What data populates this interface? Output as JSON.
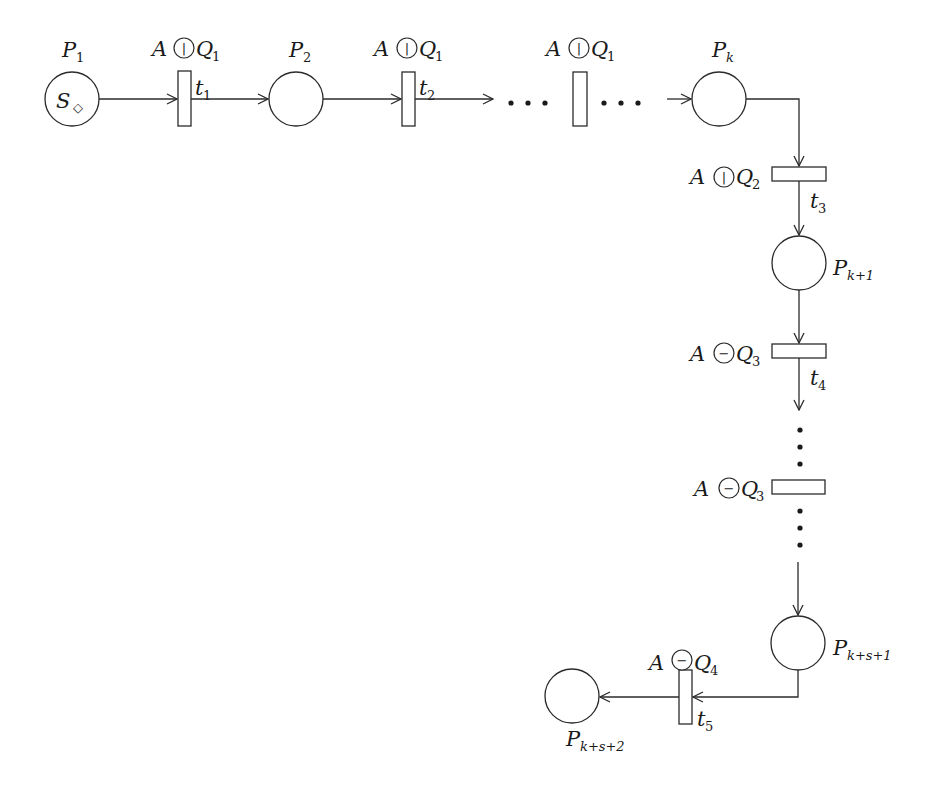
{
  "diagram": {
    "type": "petri-net",
    "places": [
      {
        "id": "P1",
        "label": "P",
        "sub": "1",
        "token": "S",
        "token_mark": "◇"
      },
      {
        "id": "P2",
        "label": "P",
        "sub": "2"
      },
      {
        "id": "Pk",
        "label": "P",
        "sub": "k"
      },
      {
        "id": "Pk1",
        "label": "P",
        "sub": "k+1"
      },
      {
        "id": "Pks1",
        "label": "P",
        "sub": "k+s+1"
      },
      {
        "id": "Pks2",
        "label": "P",
        "sub": "k+s+2"
      }
    ],
    "transitions": [
      {
        "id": "t1",
        "label": "t",
        "sub": "1",
        "guard_left": "A",
        "guard_op": "|",
        "guard_right": "Q",
        "guard_sub": "1"
      },
      {
        "id": "t2",
        "label": "t",
        "sub": "2",
        "guard_left": "A",
        "guard_op": "|",
        "guard_right": "Q",
        "guard_sub": "1"
      },
      {
        "id": "tdots_h",
        "label": "",
        "sub": "",
        "guard_left": "A",
        "guard_op": "|",
        "guard_right": "Q",
        "guard_sub": "1"
      },
      {
        "id": "t3",
        "label": "t",
        "sub": "3",
        "guard_left": "A",
        "guard_op": "|",
        "guard_right": "Q",
        "guard_sub": "2"
      },
      {
        "id": "t4",
        "label": "t",
        "sub": "4",
        "guard_left": "A",
        "guard_op": "−",
        "guard_right": "Q",
        "guard_sub": "3"
      },
      {
        "id": "tdots_v",
        "label": "",
        "sub": "",
        "guard_left": "A",
        "guard_op": "−",
        "guard_right": "Q",
        "guard_sub": "3"
      },
      {
        "id": "t5",
        "label": "t",
        "sub": "5",
        "guard_left": "A",
        "guard_op": "−",
        "guard_right": "Q",
        "guard_sub": "4"
      }
    ],
    "ellipsis": "…",
    "colors": {
      "stroke": "#2b2b2b",
      "background": "#ffffff"
    }
  }
}
